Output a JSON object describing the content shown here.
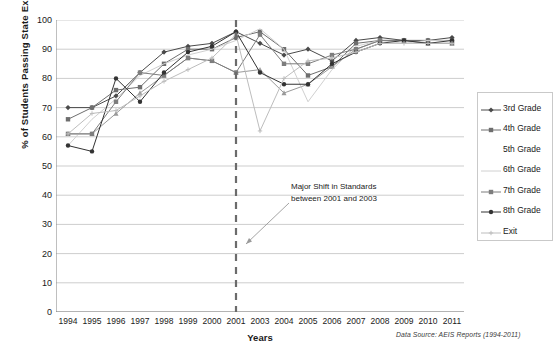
{
  "chart_data": {
    "type": "line",
    "title": "",
    "xlabel": "Years",
    "ylabel": "% of Students Passing State Exam",
    "ylim": [
      0,
      100
    ],
    "ytick_step": 10,
    "yticks": [
      0,
      10,
      20,
      30,
      40,
      50,
      60,
      70,
      80,
      90,
      100
    ],
    "grid": true,
    "grid_axis": "y",
    "legend_position": "right",
    "categories": [
      "1994",
      "1995",
      "1996",
      "1997",
      "1998",
      "1999",
      "2000",
      "2001",
      "2003",
      "2004",
      "2005",
      "2006",
      "2007",
      "2008",
      "2009",
      "2010",
      "2011"
    ],
    "series": [
      {
        "name": "3rd Grade",
        "color": "#4a4a4a",
        "marker": "diamond",
        "values": [
          70,
          70,
          74,
          82,
          89,
          91,
          92,
          96,
          92,
          88,
          90,
          86,
          93,
          94,
          93,
          93,
          94
        ]
      },
      {
        "name": "4th Grade",
        "color": "#6e6e6e",
        "marker": "square",
        "values": [
          66,
          70,
          76,
          77,
          85,
          90,
          90,
          94,
          96,
          90,
          81,
          84,
          92,
          93,
          93,
          93,
          93
        ]
      },
      {
        "name": "5th Grade",
        "color": "#9a9a9a",
        "marker": "triangle",
        "values": [
          61,
          61,
          68,
          75,
          81,
          87,
          86,
          82,
          83,
          75,
          78,
          84,
          90,
          93,
          93,
          92,
          92
        ]
      },
      {
        "name": "6th Grade",
        "color": "#d0d0d0",
        "marker": "none",
        "values": [
          57,
          66,
          73,
          81,
          85,
          88,
          90,
          93,
          97,
          90,
          72,
          83,
          91,
          93,
          92,
          93,
          93
        ]
      },
      {
        "name": "7th Grade",
        "color": "#7d7d7d",
        "marker": "square",
        "values": [
          61,
          61,
          72,
          82,
          81,
          87,
          86,
          82,
          95,
          85,
          85,
          88,
          90,
          93,
          93,
          92,
          92
        ]
      },
      {
        "name": "8th Grade",
        "color": "#333333",
        "marker": "circle",
        "values": [
          57,
          55,
          80,
          72,
          82,
          89,
          91,
          96,
          82,
          78,
          78,
          85,
          89,
          92,
          93,
          92,
          93
        ]
      },
      {
        "name": "Exit",
        "color": "#bdbdbd",
        "marker": "plus",
        "values": [
          61,
          68,
          69,
          74,
          79,
          83,
          87,
          95,
          62,
          80,
          86,
          87,
          89,
          92,
          92,
          92,
          92
        ]
      }
    ],
    "annotations": [
      {
        "name": "major-shift-note",
        "line1": "Major Shift in Standards",
        "line2": "between 2001 and 2003",
        "marker_line_year": "2001",
        "marker_line_style": "dashed"
      }
    ],
    "footnote": "Data Source:  AEIS Reports (1994-2011)"
  },
  "legend": {
    "items": [
      {
        "label": "3rd Grade"
      },
      {
        "label": "4th Grade"
      },
      {
        "label": "5th Grade"
      },
      {
        "label": "6th Grade"
      },
      {
        "label": "7th Grade"
      },
      {
        "label": "8th Grade"
      },
      {
        "label": "Exit"
      }
    ]
  }
}
